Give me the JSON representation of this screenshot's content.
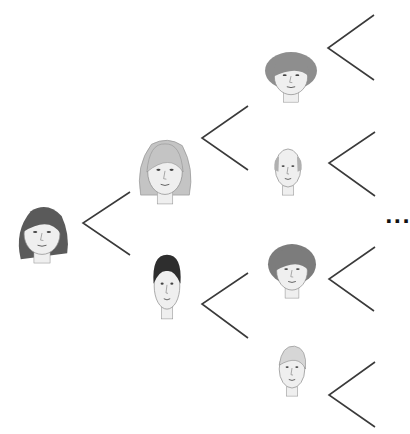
{
  "diagram": {
    "type": "ancestry-tree",
    "ellipsis": "...",
    "colors": {
      "line": "#3a3a3a",
      "skin": "#efefef",
      "outline": "#8a8a8a",
      "background": "#ffffff"
    },
    "nodes": [
      {
        "id": "self",
        "label": "young woman",
        "generation": 0,
        "hair": "#5a5a5a",
        "x": 42,
        "y": 234,
        "w": 56,
        "h": 60,
        "style": "long"
      },
      {
        "id": "mother",
        "label": "mother",
        "generation": 1,
        "hair": "#c4c4c4",
        "x": 165,
        "y": 172,
        "w": 54,
        "h": 66,
        "style": "shoulder"
      },
      {
        "id": "father",
        "label": "father",
        "generation": 1,
        "hair": "#2e2e2e",
        "x": 167,
        "y": 286,
        "w": 40,
        "h": 68,
        "style": "short"
      },
      {
        "id": "maternal-grandmother",
        "label": "maternal grandmother",
        "generation": 2,
        "hair": "#8e8e8e",
        "x": 291,
        "y": 77,
        "w": 52,
        "h": 52,
        "style": "curly"
      },
      {
        "id": "maternal-grandfather",
        "label": "maternal grandfather",
        "generation": 2,
        "hair": "#b0b0b0",
        "x": 288,
        "y": 168,
        "w": 40,
        "h": 56,
        "style": "bald"
      },
      {
        "id": "paternal-grandmother",
        "label": "paternal grandmother",
        "generation": 2,
        "hair": "#7c7c7c",
        "x": 292,
        "y": 271,
        "w": 48,
        "h": 56,
        "style": "bouffant"
      },
      {
        "id": "paternal-grandfather",
        "label": "paternal grandfather",
        "generation": 2,
        "hair": "#d6d6d6",
        "x": 292,
        "y": 369,
        "w": 40,
        "h": 56,
        "style": "swept"
      }
    ],
    "branches": [
      {
        "id": "branch-self",
        "vertex": [
          83,
          223
        ],
        "top": [
          130,
          192
        ],
        "bottom": [
          130,
          255
        ]
      },
      {
        "id": "branch-mother",
        "vertex": [
          202,
          138
        ],
        "top": [
          248,
          106
        ],
        "bottom": [
          248,
          170
        ]
      },
      {
        "id": "branch-father",
        "vertex": [
          202,
          304
        ],
        "top": [
          248,
          273
        ],
        "bottom": [
          248,
          338
        ]
      },
      {
        "id": "branch-maternal-grandmother",
        "vertex": [
          328,
          48
        ],
        "top": [
          374,
          15
        ],
        "bottom": [
          374,
          80
        ]
      },
      {
        "id": "branch-maternal-grandfather",
        "vertex": [
          329,
          163
        ],
        "top": [
          375,
          132
        ],
        "bottom": [
          375,
          196
        ]
      },
      {
        "id": "branch-paternal-grandmother",
        "vertex": [
          329,
          279
        ],
        "top": [
          375,
          247
        ],
        "bottom": [
          374,
          311
        ]
      },
      {
        "id": "branch-paternal-grandfather",
        "vertex": [
          329,
          395
        ],
        "top": [
          375,
          362
        ],
        "bottom": [
          375,
          427
        ]
      }
    ]
  }
}
